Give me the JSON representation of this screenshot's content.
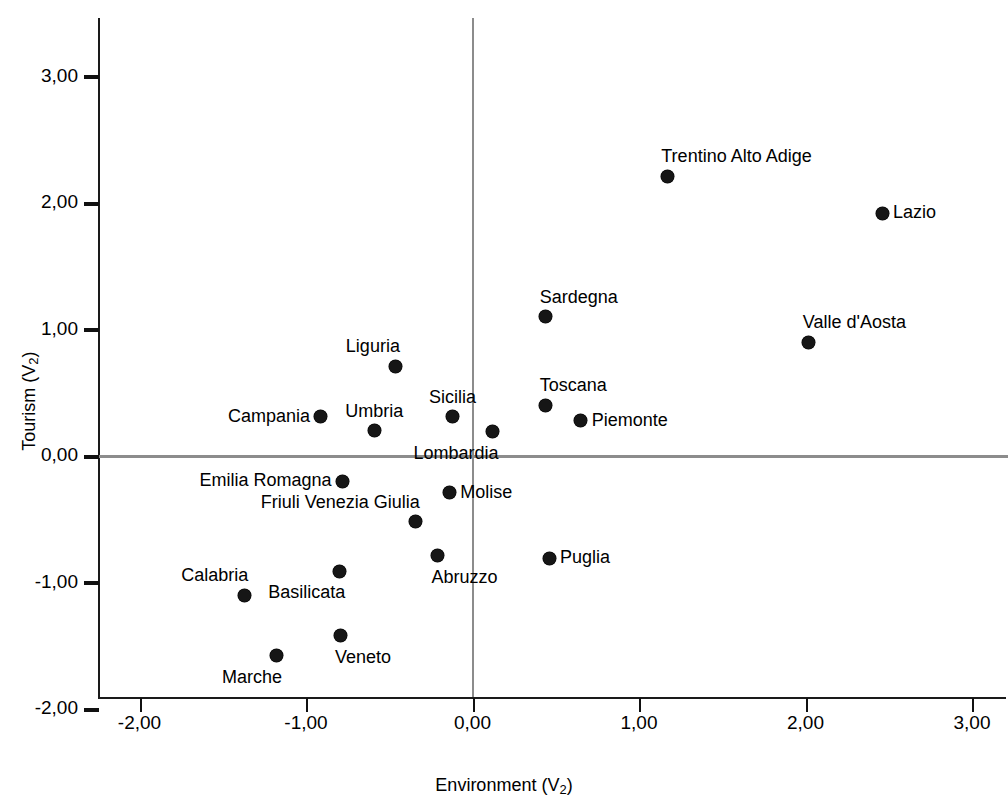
{
  "chart_data": {
    "type": "scatter",
    "title": "",
    "xlabel": "Environment (V₂)",
    "ylabel": "Tourism (V₂)",
    "xlim": [
      -2.5,
      3.2
    ],
    "ylim": [
      -2.0,
      3.45
    ],
    "xticks": [
      "-2,00",
      "-1,00",
      "0,00",
      "1,00",
      "2,00",
      "3,00"
    ],
    "xtick_values": [
      -2,
      -1,
      0,
      1,
      2,
      3
    ],
    "yticks": [
      "3,00",
      "2,00",
      "1,00",
      "0,00",
      "-1,00",
      "-2,00"
    ],
    "ytick_values": [
      3,
      2,
      1,
      0,
      -1,
      -2
    ],
    "grid": false,
    "legend": "none",
    "reference_lines": [
      {
        "orientation": "horizontal",
        "value": 0,
        "color": "#8c8c8c"
      },
      {
        "orientation": "vertical",
        "value": 0,
        "color": "#8c8c8c"
      }
    ],
    "point_color": "#161616",
    "points": [
      {
        "label": "Trentino Alto Adige",
        "x": 1.17,
        "y": 2.21,
        "label_pos": "above-right"
      },
      {
        "label": "Lazio",
        "x": 2.46,
        "y": 1.92,
        "label_pos": "right"
      },
      {
        "label": "Sardegna",
        "x": 0.44,
        "y": 1.1,
        "label_pos": "above-right"
      },
      {
        "label": "Valle d'Aosta",
        "x": 2.02,
        "y": 0.9,
        "label_pos": "above-right"
      },
      {
        "label": "Liguria",
        "x": -0.46,
        "y": 0.71,
        "label_pos": "above-left"
      },
      {
        "label": "Toscana",
        "x": 0.44,
        "y": 0.4,
        "label_pos": "above-right"
      },
      {
        "label": "Sicilia",
        "x": -0.12,
        "y": 0.31,
        "label_pos": "above"
      },
      {
        "label": "Campania",
        "x": -0.91,
        "y": 0.31,
        "label_pos": "left"
      },
      {
        "label": "Piemonte",
        "x": 0.65,
        "y": 0.28,
        "label_pos": "right"
      },
      {
        "label": "Umbria",
        "x": -0.59,
        "y": 0.2,
        "label_pos": "above"
      },
      {
        "label": "Lombardia",
        "x": 0.12,
        "y": 0.19,
        "label_pos": "below-left"
      },
      {
        "label": "Emilia Romagna",
        "x": -0.78,
        "y": -0.2,
        "label_pos": "left"
      },
      {
        "label": "Molise",
        "x": -0.14,
        "y": -0.29,
        "label_pos": "right"
      },
      {
        "label": "Friuli Venezia Giulia",
        "x": -0.34,
        "y": -0.52,
        "label_pos": "above-left"
      },
      {
        "label": "Puglia",
        "x": 0.46,
        "y": -0.81,
        "label_pos": "right"
      },
      {
        "label": "Abruzzo",
        "x": -0.21,
        "y": -0.79,
        "label_pos": "below-right"
      },
      {
        "label": "Basilicata",
        "x": -0.8,
        "y": -0.91,
        "label_pos": "below-left"
      },
      {
        "label": "Calabria",
        "x": -1.37,
        "y": -1.1,
        "label_pos": "above-left"
      },
      {
        "label": "Veneto",
        "x": -0.79,
        "y": -1.42,
        "label_pos": "below-right"
      },
      {
        "label": "Marche",
        "x": -1.18,
        "y": -1.58,
        "label_pos": "below-left"
      }
    ]
  }
}
